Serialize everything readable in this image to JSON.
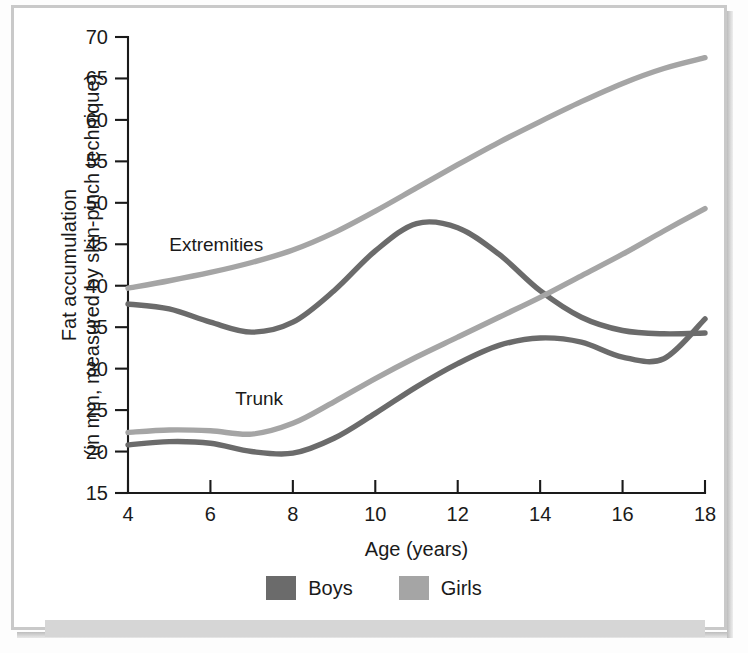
{
  "figure": {
    "background_color": "#ffffff",
    "frame_color": "#c9c9c9",
    "band_color": "#d6d6d6"
  },
  "legend": {
    "position": "bottom-center",
    "entries": [
      {
        "label": "Boys",
        "color": "#6b6b6b"
      },
      {
        "label": "Girls",
        "color": "#a5a5a5"
      }
    ]
  },
  "annotations": [
    {
      "name": "extremities-label",
      "text": "Extremities",
      "x_age": 5.0,
      "y_value": 44.2
    },
    {
      "name": "trunk-label",
      "text": "Trunk",
      "x_age": 6.6,
      "y_value": 25.6
    }
  ],
  "chart_data": {
    "type": "line",
    "title": "",
    "xlabel": "Age (years)",
    "ylabel": "Fat accumulation\n(in mm, measured by skin-pinch technique)",
    "ylabel_line1": "Fat accumulation",
    "ylabel_line2": "(in mm, measured by skin-pinch technique)",
    "xlim": [
      4,
      18
    ],
    "ylim": [
      15,
      70
    ],
    "xticks": [
      4,
      6,
      8,
      10,
      12,
      14,
      16,
      18
    ],
    "xticklabels": [
      "4",
      "6",
      "8",
      "10",
      "12",
      "14",
      "16",
      "18"
    ],
    "yticks": [
      15,
      20,
      25,
      30,
      35,
      40,
      45,
      50,
      55,
      60,
      65,
      70
    ],
    "yticklabels": [
      "15",
      "20",
      "25",
      "30",
      "35",
      "40",
      "45",
      "50",
      "55",
      "60",
      "65",
      "70"
    ],
    "grid": false,
    "legend_position": "bottom",
    "x": [
      4,
      5,
      6,
      7,
      8,
      9,
      10,
      11,
      12,
      13,
      14,
      15,
      16,
      17,
      18
    ],
    "series": [
      {
        "name": "Girls — Extremities",
        "group": "Girls",
        "region": "Extremities",
        "color": "#a5a5a5",
        "values": [
          39.7,
          40.6,
          41.6,
          42.8,
          44.3,
          46.4,
          49.0,
          51.8,
          54.6,
          57.3,
          59.8,
          62.2,
          64.4,
          66.2,
          67.5
        ]
      },
      {
        "name": "Boys — Extremities",
        "group": "Boys",
        "region": "Extremities",
        "color": "#6b6b6b",
        "values": [
          37.8,
          37.2,
          35.6,
          34.4,
          35.6,
          39.4,
          44.2,
          47.5,
          47.0,
          43.8,
          39.4,
          36.2,
          34.6,
          34.2,
          34.3
        ]
      },
      {
        "name": "Girls — Trunk",
        "group": "Girls",
        "region": "Trunk",
        "color": "#a5a5a5",
        "values": [
          22.3,
          22.6,
          22.5,
          22.1,
          23.4,
          26.0,
          28.8,
          31.4,
          33.8,
          36.2,
          38.6,
          41.2,
          43.8,
          46.6,
          49.3
        ]
      },
      {
        "name": "Boys — Trunk",
        "group": "Boys",
        "region": "Trunk",
        "color": "#6b6b6b",
        "values": [
          20.8,
          21.2,
          21.0,
          20.0,
          19.8,
          21.6,
          24.6,
          27.8,
          30.6,
          32.8,
          33.7,
          33.2,
          31.4,
          31.2,
          36.0
        ]
      }
    ]
  }
}
